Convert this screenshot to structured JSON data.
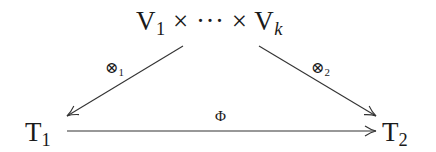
{
  "diagram": {
    "type": "commutative-diagram",
    "nodes": {
      "top": {
        "parts": [
          "V",
          "1",
          " × ··· × ",
          "V",
          "k"
        ],
        "text": "V₁ × ··· × V_k"
      },
      "left": {
        "base": "T",
        "sub": "1",
        "text": "T₁"
      },
      "right": {
        "base": "T",
        "sub": "2",
        "text": "T₂"
      }
    },
    "edges": [
      {
        "from": "top",
        "to": "left",
        "label": {
          "base": "⊗",
          "sub": "1"
        }
      },
      {
        "from": "top",
        "to": "right",
        "label": {
          "base": "⊗",
          "sub": "2"
        }
      },
      {
        "from": "left",
        "to": "right",
        "label": {
          "base": "Φ"
        }
      }
    ],
    "colors": {
      "stroke": "#333333",
      "text": "#1a1a1a",
      "background": "#ffffff"
    }
  }
}
